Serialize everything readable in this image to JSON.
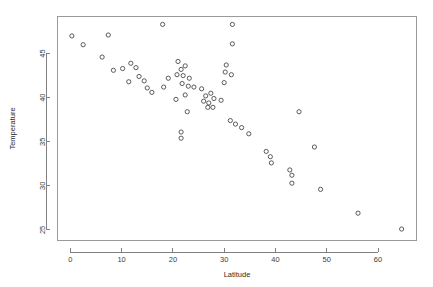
{
  "chart_data": {
    "type": "scatter",
    "title": "",
    "xlabel": "Latitude",
    "ylabel": "Temperature",
    "xlim": [
      -2.5,
      67.5
    ],
    "ylim": [
      23.8,
      49.2
    ],
    "xticks": [
      0,
      10,
      20,
      30,
      40,
      50,
      60
    ],
    "xtick_labels": [
      "0",
      "10",
      "20",
      "30",
      "40",
      "50",
      "60"
    ],
    "yticks": [
      25,
      30,
      35,
      40,
      45
    ],
    "ytick_labels": [
      "25",
      "30",
      "35",
      "40",
      "45"
    ],
    "grid": false,
    "legend": null,
    "marker": "open-circle",
    "marker_color": "#4a4a4a",
    "points": [
      {
        "x": 0.3,
        "y": 47.0
      },
      {
        "x": 2.5,
        "y": 46.0
      },
      {
        "x": 7.4,
        "y": 47.1
      },
      {
        "x": 6.2,
        "y": 44.6
      },
      {
        "x": 8.4,
        "y": 43.1
      },
      {
        "x": 10.2,
        "y": 43.3
      },
      {
        "x": 11.8,
        "y": 43.9
      },
      {
        "x": 12.8,
        "y": 43.4
      },
      {
        "x": 13.4,
        "y": 42.4
      },
      {
        "x": 11.4,
        "y": 41.8
      },
      {
        "x": 14.4,
        "y": 41.9
      },
      {
        "x": 15.0,
        "y": 41.1
      },
      {
        "x": 15.9,
        "y": 40.6
      },
      {
        "x": 18.0,
        "y": 48.3
      },
      {
        "x": 19.1,
        "y": 42.2
      },
      {
        "x": 18.2,
        "y": 41.2
      },
      {
        "x": 21.0,
        "y": 44.1
      },
      {
        "x": 21.6,
        "y": 43.2
      },
      {
        "x": 22.4,
        "y": 43.6
      },
      {
        "x": 20.8,
        "y": 42.6
      },
      {
        "x": 22.0,
        "y": 42.5
      },
      {
        "x": 23.2,
        "y": 42.2
      },
      {
        "x": 21.8,
        "y": 41.6
      },
      {
        "x": 23.0,
        "y": 41.3
      },
      {
        "x": 24.1,
        "y": 41.2
      },
      {
        "x": 22.4,
        "y": 40.3
      },
      {
        "x": 20.6,
        "y": 39.8
      },
      {
        "x": 22.8,
        "y": 38.4
      },
      {
        "x": 21.6,
        "y": 36.1
      },
      {
        "x": 21.6,
        "y": 35.4
      },
      {
        "x": 25.6,
        "y": 41.0
      },
      {
        "x": 26.4,
        "y": 40.2
      },
      {
        "x": 27.4,
        "y": 40.5
      },
      {
        "x": 26.0,
        "y": 39.6
      },
      {
        "x": 27.0,
        "y": 39.4
      },
      {
        "x": 28.0,
        "y": 39.9
      },
      {
        "x": 26.8,
        "y": 38.9
      },
      {
        "x": 27.8,
        "y": 38.9
      },
      {
        "x": 29.4,
        "y": 39.7
      },
      {
        "x": 31.6,
        "y": 48.3
      },
      {
        "x": 31.6,
        "y": 46.1
      },
      {
        "x": 30.4,
        "y": 43.7
      },
      {
        "x": 30.2,
        "y": 42.9
      },
      {
        "x": 31.4,
        "y": 42.6
      },
      {
        "x": 30.0,
        "y": 41.7
      },
      {
        "x": 31.2,
        "y": 37.4
      },
      {
        "x": 32.2,
        "y": 37.0
      },
      {
        "x": 33.4,
        "y": 36.6
      },
      {
        "x": 34.8,
        "y": 35.9
      },
      {
        "x": 38.2,
        "y": 33.9
      },
      {
        "x": 39.0,
        "y": 33.3
      },
      {
        "x": 39.2,
        "y": 32.6
      },
      {
        "x": 42.8,
        "y": 31.8
      },
      {
        "x": 43.2,
        "y": 31.2
      },
      {
        "x": 43.2,
        "y": 30.3
      },
      {
        "x": 44.6,
        "y": 38.4
      },
      {
        "x": 47.6,
        "y": 34.4
      },
      {
        "x": 48.8,
        "y": 29.6
      },
      {
        "x": 56.1,
        "y": 26.9
      },
      {
        "x": 64.6,
        "y": 25.1
      }
    ]
  }
}
